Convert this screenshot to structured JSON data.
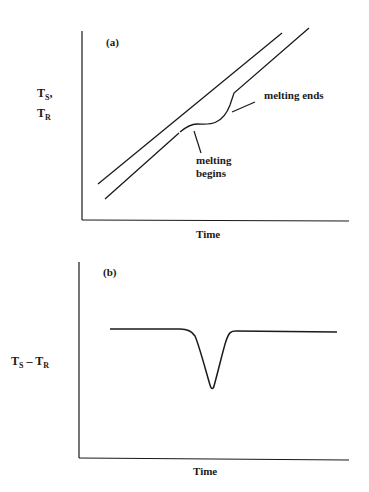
{
  "panel_a": {
    "tag": "(a)",
    "ylabel_line1_main": "T",
    "ylabel_line1_sub": "S",
    "ylabel_line1_suffix": ",",
    "ylabel_line2_main": "T",
    "ylabel_line2_sub": "R",
    "xlabel": "Time",
    "annotation_begins_line1": "melting",
    "annotation_begins_line2": "begins",
    "annotation_ends": "melting ends"
  },
  "panel_b": {
    "tag": "(b)",
    "ylabel_main1": "T",
    "ylabel_sub1": "S",
    "ylabel_minus": " – ",
    "ylabel_main2": "T",
    "ylabel_sub2": "R",
    "xlabel": "Time"
  },
  "colors": {
    "line": "#1a1a1a",
    "background": "#ffffff"
  }
}
